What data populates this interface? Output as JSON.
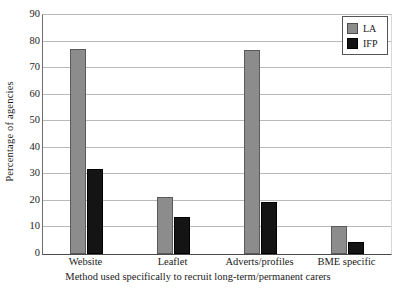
{
  "chart_data": {
    "type": "bar",
    "title": "",
    "xlabel": "Method used specifically to recruit long-term/permanent carers",
    "ylabel": "Percentage of agencies",
    "categories": [
      "Website",
      "Leaflet",
      "Adverts/profiles",
      "BME specific"
    ],
    "series": [
      {
        "name": "LA",
        "color": "#8c8c8c",
        "values": [
          77.3,
          21.3,
          76.8,
          10.5
        ]
      },
      {
        "name": "IFP",
        "color": "#121212",
        "values": [
          32.0,
          14.0,
          19.5,
          4.5
        ]
      }
    ],
    "ylim": [
      0,
      90
    ],
    "ytick_values": [
      0,
      10,
      20,
      30,
      40,
      50,
      60,
      70,
      80,
      90
    ],
    "ytick_labels": [
      "0",
      "10",
      "20",
      "30",
      "40",
      "50",
      "60",
      "70",
      "80",
      "90"
    ],
    "grid": true,
    "grid_axis": "y",
    "legend": {
      "position": "top-right",
      "entries": [
        {
          "label": "LA",
          "swatch": "legend-swatch-la"
        },
        {
          "label": "IFP",
          "swatch": "legend-swatch-ifp"
        }
      ]
    }
  },
  "axes": {
    "y_title": "Percentage of agencies",
    "x_title": "Method used specifically to recruit long-term/permanent carers"
  },
  "ticks": {
    "y": [
      "90",
      "80",
      "70",
      "60",
      "50",
      "40",
      "30",
      "20",
      "10",
      "0"
    ],
    "x": [
      "Website",
      "Leaflet",
      "Adverts/profiles",
      "BME specific"
    ]
  },
  "legend_labels": {
    "la": "LA",
    "ifp": "IFP"
  }
}
